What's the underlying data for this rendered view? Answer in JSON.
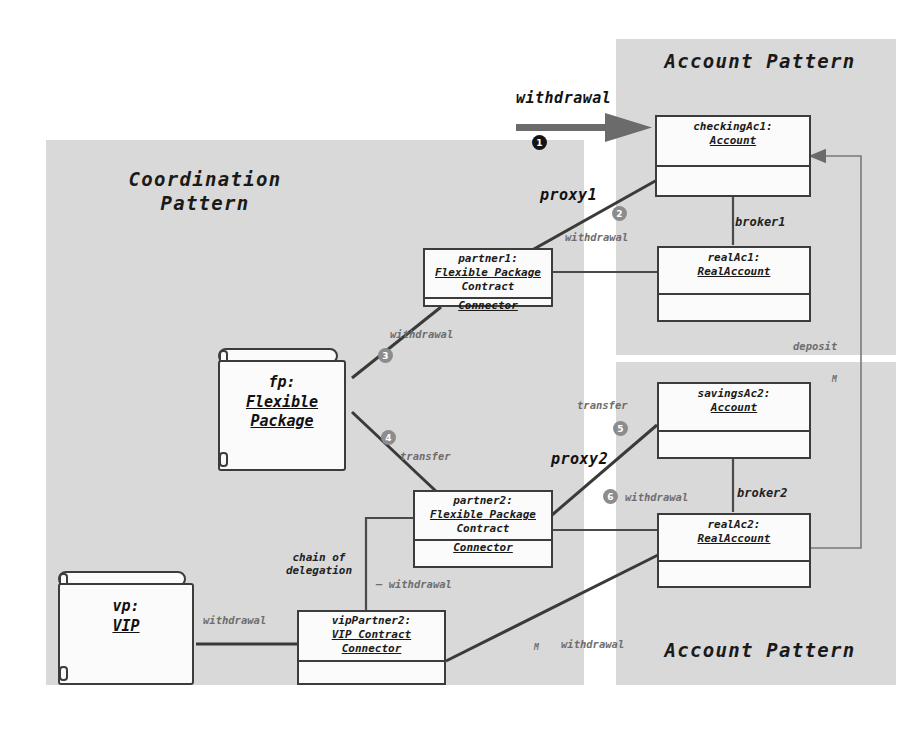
{
  "diagram": {
    "panels": [
      {
        "name": "account-pattern-top",
        "label": "Account Pattern"
      },
      {
        "name": "coordination-pattern",
        "label": "Coordination\nPattern"
      },
      {
        "name": "account-pattern-bottom",
        "label": "Account Pattern"
      }
    ],
    "objects": [
      {
        "id": "checkingAc1",
        "name_line": "checkingAc1:",
        "type_line": "Account",
        "extra": []
      },
      {
        "id": "realAc1",
        "name_line": "realAc1:",
        "type_line": "RealAccount",
        "extra": []
      },
      {
        "id": "partner1",
        "name_line": "partner1:",
        "type_line": "Flexible Package",
        "extra": [
          "Contract",
          "Connector"
        ]
      },
      {
        "id": "savingsAc2",
        "name_line": "savingsAc2:",
        "type_line": "Account",
        "extra": []
      },
      {
        "id": "realAc2",
        "name_line": "realAc2:",
        "type_line": "RealAccount",
        "extra": []
      },
      {
        "id": "partner2",
        "name_line": "partner2:",
        "type_line": "Flexible Package",
        "extra": [
          "Contract",
          "Connector"
        ]
      },
      {
        "id": "vipPartner2",
        "name_line": "vipPartner2:",
        "type_line": "VIP Contract",
        "extra": [
          "Connector"
        ]
      }
    ],
    "packages": [
      {
        "id": "fp",
        "name_line": "fp:",
        "type_line": "Flexible\nPackage"
      },
      {
        "id": "vp",
        "name_line": "vp:",
        "type_line": "VIP"
      }
    ],
    "steps": [
      {
        "n": "❶",
        "num": "1",
        "style": "dark",
        "message": "withdrawal"
      },
      {
        "n": "❷",
        "num": "2",
        "style": "grey",
        "message": "withdrawal"
      },
      {
        "n": "❸",
        "num": "3",
        "style": "grey",
        "message": "withdrawal"
      },
      {
        "n": "❹",
        "num": "4",
        "style": "grey",
        "message": "transfer"
      },
      {
        "n": "❺",
        "num": "5",
        "style": "grey",
        "message": "transfer"
      },
      {
        "n": "❻",
        "num": "6",
        "style": "grey",
        "message": "withdrawal"
      }
    ],
    "edge_labels": {
      "withdrawal_entry": "withdrawal",
      "proxy1": "proxy1",
      "proxy2": "proxy2",
      "broker1": "broker1",
      "broker2": "broker2",
      "deposit": "deposit",
      "withdrawal_2": "withdrawal",
      "withdrawal_3": "withdrawal",
      "transfer_4": "transfer",
      "transfer_5": "transfer",
      "withdrawal_6": "withdrawal",
      "chain_of_delegation": "chain of\ndelegation",
      "withdrawal_chain": "—  withdrawal",
      "withdrawal_vp": "withdrawal",
      "withdrawal_vip_real": "withdrawal",
      "mult_top": "M",
      "mult_bottom": "M"
    },
    "colors": {
      "panel_fill": "#d9d9d9",
      "box_fill": "#fbfbfb",
      "box_stroke": "#3c3c3c",
      "link_stroke": "#4a4a4a",
      "thick_link": "#3a3a3a",
      "arrow_fill": "#6b6b6b",
      "step_dark": "#141414",
      "step_grey": "#8c8c8c",
      "text": "#1a1a1a"
    }
  }
}
